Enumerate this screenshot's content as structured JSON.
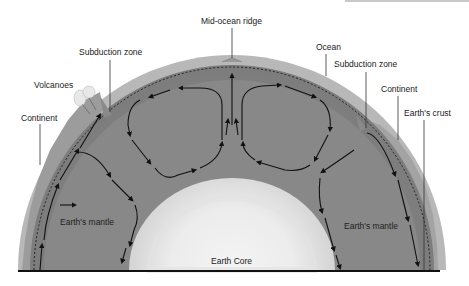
{
  "labels": {
    "mid_ocean_ridge": "Mid-ocean ridge",
    "subduction_zone_left": "Subduction zone",
    "ocean": "Ocean",
    "subduction_zone_right": "Subduction zone",
    "volcanoes": "Volcanoes",
    "continent_left": "Continent",
    "continent_right": "Continent",
    "earths_crust": "Earth's crust",
    "earths_mantle_left": "Earth's mantle",
    "earths_mantle_right": "Earth's mantle",
    "earth_core": "Earth Core"
  },
  "colors": {
    "background": "#ffffff",
    "crust": "#b9b9b9",
    "mantle_outer": "#8e8e8e",
    "mantle_inner": "#7f7f7f",
    "core_center": "#f2f2f2",
    "core_edge": "#d6d6d6",
    "arrows": "#111111",
    "baseline": "#111111"
  }
}
